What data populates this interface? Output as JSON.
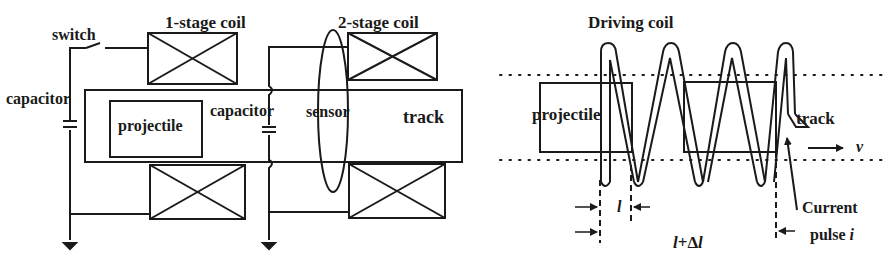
{
  "left_figure": {
    "labels": {
      "switch": "switch",
      "stage1_coil": "1-stage coil",
      "stage2_coil": "2-stage coil",
      "capacitor_left": "capacitor",
      "capacitor_mid": "capacitor",
      "projectile": "projectile",
      "sensor": "sensor",
      "track": "track"
    }
  },
  "right_figure": {
    "labels": {
      "driving_coil": "Driving coil",
      "projectile": "projectile",
      "track": "track",
      "velocity": "v",
      "current_line1": "Current",
      "current_line2": "pulse ",
      "current_symbol": "i",
      "length_l": "l",
      "length_total_l": "l",
      "length_total_plus": "+",
      "length_total_delta": "Δ",
      "length_total_l2": "l"
    }
  },
  "colors": {
    "stroke": "#1a1a1a",
    "background": "#ffffff"
  }
}
